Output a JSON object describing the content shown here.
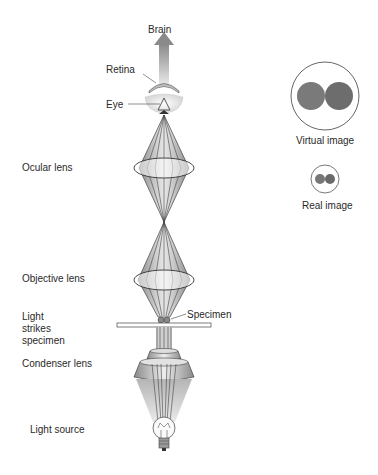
{
  "labels": {
    "brain": "Brain",
    "retina": "Retina",
    "eye": "Eye",
    "ocular_lens": "Ocular lens",
    "objective_lens": "Objective lens",
    "light_strikes_1": "Light",
    "light_strikes_2": "strikes",
    "light_strikes_3": "specimen",
    "specimen": "Specimen",
    "condenser_lens": "Condenser lens",
    "light_source": "Light source",
    "virtual_image": "Virtual image",
    "real_image": "Real image"
  },
  "colors": {
    "cone_dark": "#8c8c8c",
    "cone_light": "#d9d9d9",
    "line": "#333333",
    "image_circle": "#7a7a7a",
    "arrow": "#9a9a9a"
  }
}
